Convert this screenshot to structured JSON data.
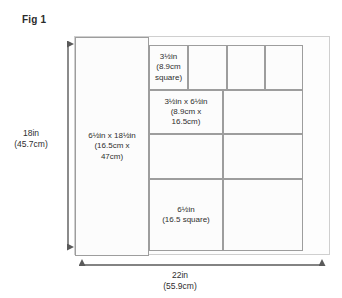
{
  "figure": {
    "title": "Fig 1"
  },
  "dimensions": {
    "vertical": {
      "name": "height",
      "label": "18in\n(45.7cm)",
      "imperial": "18in",
      "metric": "45.7cm"
    },
    "horizontal": {
      "name": "width",
      "label": "22in\n(55.9cm)",
      "imperial": "22in",
      "metric": "55.9cm"
    }
  },
  "pieces": [
    {
      "id": "left-strip",
      "label": "6½in x 18½in\n(16.5cm x\n47cm)",
      "x": 0,
      "y": 0,
      "w": 74,
      "h": 219
    },
    {
      "id": "top-square-1",
      "label": "3½in\n(8.9cm\nsquare)",
      "x": 74,
      "y": 8,
      "w": 39,
      "h": 45
    },
    {
      "id": "top-square-2",
      "label": "",
      "x": 113,
      "y": 8,
      "w": 39,
      "h": 45
    },
    {
      "id": "top-square-3",
      "label": "",
      "x": 152,
      "y": 8,
      "w": 38,
      "h": 45
    },
    {
      "id": "top-square-4",
      "label": "",
      "x": 190,
      "y": 8,
      "w": 38,
      "h": 45
    },
    {
      "id": "mid-left-1",
      "label": "3½in x 6½in\n(8.9cm x\n16.5cm)",
      "x": 74,
      "y": 53,
      "w": 74,
      "h": 44
    },
    {
      "id": "mid-right-1",
      "label": "",
      "x": 148,
      "y": 53,
      "w": 80,
      "h": 44
    },
    {
      "id": "mid-left-2",
      "label": "",
      "x": 74,
      "y": 97,
      "w": 74,
      "h": 45
    },
    {
      "id": "mid-right-2",
      "label": "",
      "x": 148,
      "y": 97,
      "w": 80,
      "h": 45
    },
    {
      "id": "bottom-left",
      "label": "6½in\n(16.5 square)",
      "x": 74,
      "y": 142,
      "w": 74,
      "h": 72
    },
    {
      "id": "bottom-right",
      "label": "",
      "x": 148,
      "y": 142,
      "w": 80,
      "h": 72
    }
  ],
  "colors": {
    "line": "#9d9d9d",
    "frame": "#cfcfcf",
    "arrow": "#5a5a5a",
    "text": "#2e2e2e",
    "background": "#ffffff"
  }
}
